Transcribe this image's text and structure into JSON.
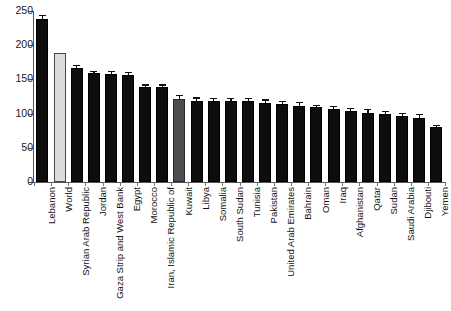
{
  "chart_data": {
    "type": "bar",
    "title": "",
    "subtitle": "",
    "xlabel": "",
    "ylabel": "",
    "ylim": [
      0,
      250
    ],
    "ytick_labels": [
      "0",
      "50",
      "100",
      "150",
      "200",
      "250"
    ],
    "ytick_values": [
      0,
      50,
      100,
      150,
      200,
      250
    ],
    "grid": false,
    "legend": null,
    "orientation": "vertical",
    "error_bars": true,
    "categories": [
      "Lebanon",
      "World",
      "Syrian Arab Republic",
      "Jordan",
      "Gaza Strip and West Bank",
      "Egypt",
      "Morocco",
      "Iran, Islamic Republic of",
      "Kuwait",
      "Libya",
      "Somalia",
      "South Sudan",
      "Tunisia",
      "Pakistan",
      "United Arab Emirates",
      "Bahrain",
      "Oman",
      "Iraq",
      "Afghanistan",
      "Qatar",
      "Sudan",
      "Saudi Arabia",
      "Djibouti",
      "Yemen"
    ],
    "values": [
      238,
      188,
      167,
      159,
      158,
      157,
      139,
      139,
      122,
      119,
      119,
      119,
      118,
      115,
      114,
      111,
      109,
      107,
      104,
      101,
      100,
      96,
      93,
      80
    ],
    "errors": [
      4,
      0,
      2,
      2,
      3,
      2,
      2,
      2,
      4,
      3,
      2,
      2,
      3,
      4,
      3,
      4,
      2,
      2,
      3,
      4,
      2,
      3,
      5,
      2
    ],
    "bar_colors": [
      "#0d0d0d",
      "#dcdcdc",
      "#0d0d0d",
      "#0d0d0d",
      "#0d0d0d",
      "#0d0d0d",
      "#0d0d0d",
      "#0d0d0d",
      "#4d4d4d",
      "#0d0d0d",
      "#0d0d0d",
      "#0d0d0d",
      "#0d0d0d",
      "#0d0d0d",
      "#0d0d0d",
      "#0d0d0d",
      "#0d0d0d",
      "#0d0d0d",
      "#0d0d0d",
      "#0d0d0d",
      "#0d0d0d",
      "#0d0d0d",
      "#0d0d0d",
      "#0d0d0d"
    ],
    "highlight": {
      "world_color": "#dcdcdc",
      "kuwait_color": "#4d4d4d",
      "default_color": "#0d0d0d",
      "axis_color": "#555555",
      "text_color": "#111111"
    }
  }
}
